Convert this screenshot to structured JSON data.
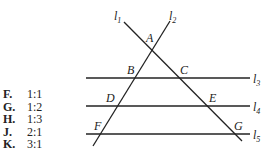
{
  "answer_choices": [
    {
      "letter": "F.",
      "value": "1:1"
    },
    {
      "letter": "G.",
      "value": "1:2"
    },
    {
      "letter": "H.",
      "value": "1:3"
    },
    {
      "letter": "J.",
      "value": "2:1"
    },
    {
      "letter": "K.",
      "value": "3:1"
    }
  ],
  "diagram": {
    "line_labels": {
      "l1": {
        "base": "l",
        "sub": "1"
      },
      "l2": {
        "base": "l",
        "sub": "2"
      },
      "l3": {
        "base": "l",
        "sub": "3"
      },
      "l4": {
        "base": "l",
        "sub": "4"
      },
      "l5": {
        "base": "l",
        "sub": "5"
      }
    },
    "points": {
      "A": "A",
      "B": "B",
      "C": "C",
      "D": "D",
      "E": "E",
      "F": "F",
      "G": "G"
    }
  }
}
